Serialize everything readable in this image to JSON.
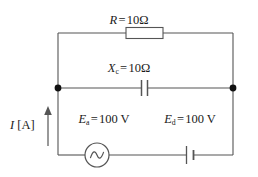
{
  "diagram": {
    "stroke_color": "#555555",
    "node_color": "#111111",
    "text_color": "#1a1a1a",
    "background": "#ffffff"
  },
  "components": {
    "resistor": {
      "symbol_name": "resistor-symbol",
      "var": "R",
      "equals": "=",
      "value": "10",
      "unit": "Ω",
      "label_full": "R = 10Ω"
    },
    "capacitor": {
      "symbol_name": "capacitor-symbol",
      "var": "X",
      "subscript": "c",
      "equals": "=",
      "value": "10",
      "unit": "Ω",
      "label_full": "Xᴄ = 10Ω"
    },
    "ac_source": {
      "symbol_name": "ac-source-symbol",
      "var": "E",
      "subscript": "a",
      "equals": "=",
      "value": "100",
      "unit": "V",
      "label_full": "Eₐ = 100 V"
    },
    "dc_source": {
      "symbol_name": "dc-source-symbol",
      "var": "E",
      "subscript": "d",
      "equals": "=",
      "value": "100",
      "unit": "V",
      "label_full": "Eᵈ = 100 V"
    },
    "current": {
      "symbol_name": "current-arrow",
      "var": "I",
      "unit_open": "[",
      "unit": "A",
      "unit_close": "]",
      "label_full": "I [A]"
    }
  },
  "nodes": [
    {
      "name": "left-junction-node"
    },
    {
      "name": "right-junction-node"
    }
  ]
}
